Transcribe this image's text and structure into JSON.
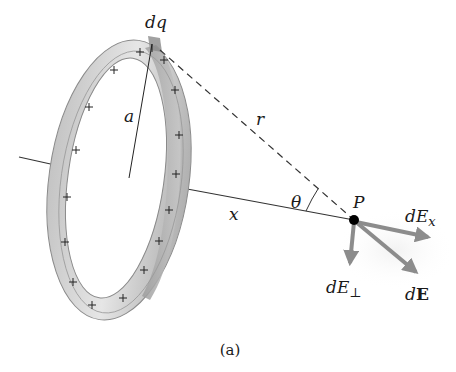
{
  "figure": {
    "caption": "(a)",
    "labels": {
      "charge_element": "dq",
      "radius": "a",
      "distance_r": "r",
      "axis_distance": "x",
      "angle": "θ",
      "point": "P",
      "field_x_d": "dE",
      "field_x_sub": "x",
      "field_perp_d": "dE",
      "field_perp_sub": "⊥",
      "field_total_d": "d",
      "field_total_vec": "E"
    },
    "ring": {
      "charge_sign": "+",
      "charge_count": 18
    },
    "colors": {
      "ring_outer": "#b8b8b8",
      "ring_face": "#d6d6d6",
      "ring_dark": "#9a9a9a",
      "arrow": "#8c8c8c",
      "line": "#333333",
      "point": "#000000"
    }
  }
}
